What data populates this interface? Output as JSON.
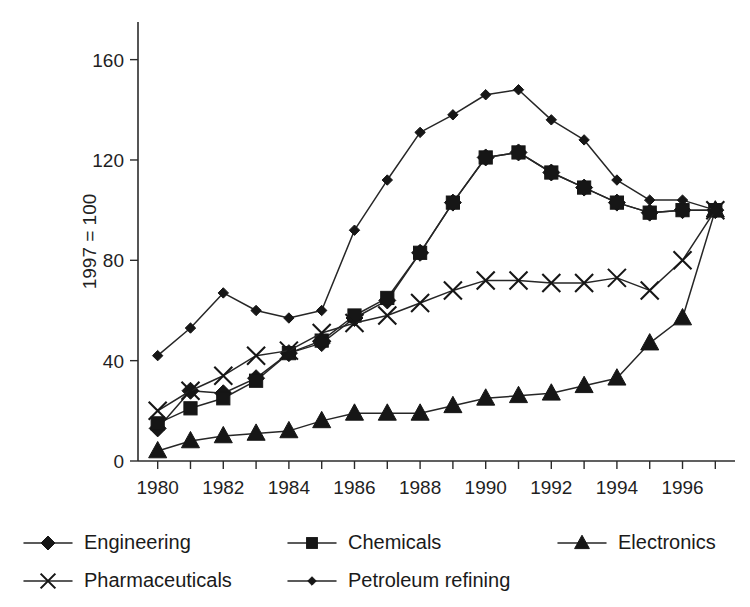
{
  "chart_data": {
    "type": "line",
    "title": "",
    "subtitle": "",
    "xlabel": "",
    "ylabel": "1997 = 100",
    "xlim": [
      1979.4,
      1997.6
    ],
    "ylim": [
      0,
      175
    ],
    "yticks": [
      0,
      40,
      80,
      120,
      160
    ],
    "ytick_labels": [
      "0",
      "40",
      "80",
      "120",
      "160"
    ],
    "x": [
      1980,
      1981,
      1982,
      1983,
      1984,
      1985,
      1986,
      1987,
      1988,
      1989,
      1990,
      1991,
      1992,
      1993,
      1994,
      1995,
      1996,
      1997
    ],
    "xticks": [
      1980,
      1981,
      1982,
      1983,
      1984,
      1985,
      1986,
      1987,
      1988,
      1989,
      1990,
      1991,
      1992,
      1993,
      1994,
      1995,
      1996,
      1997
    ],
    "xtick_labels": [
      "1980",
      "",
      "1982",
      "",
      "1984",
      "",
      "1986",
      "",
      "1988",
      "",
      "1990",
      "",
      "1992",
      "",
      "1994",
      "",
      "1996",
      ""
    ],
    "xtick_labels_shown": [
      "1980",
      "1982",
      "1984",
      "1986",
      "1988",
      "1990",
      "1992",
      "1994",
      "1996"
    ],
    "grid": false,
    "legend_position": "below",
    "line_color": "#262626",
    "series": [
      {
        "name": "Engineering",
        "marker": "diamond",
        "values": [
          13,
          28,
          27,
          33,
          43,
          47,
          57,
          64,
          83,
          103,
          121,
          123,
          115,
          109,
          103,
          99,
          100,
          100
        ]
      },
      {
        "name": "Chemicals",
        "marker": "square",
        "values": [
          15,
          21,
          25,
          32,
          43,
          48,
          58,
          65,
          83,
          103,
          121,
          123,
          115,
          109,
          103,
          99,
          100,
          100
        ]
      },
      {
        "name": "Electronics",
        "marker": "triangle",
        "values": [
          4,
          8,
          10,
          11,
          12,
          16,
          19,
          19,
          19,
          22,
          25,
          26,
          27,
          30,
          33,
          47,
          57,
          100
        ]
      },
      {
        "name": "Pharmaceuticals",
        "marker": "x",
        "values": [
          20,
          28,
          34,
          42,
          44,
          51,
          55,
          58,
          63,
          68,
          72,
          72,
          71,
          71,
          73,
          68,
          80,
          100
        ]
      },
      {
        "name": "Petroleum refining",
        "marker": "small-diamond",
        "values": [
          42,
          53,
          67,
          60,
          57,
          60,
          92,
          112,
          131,
          138,
          146,
          148,
          136,
          128,
          112,
          104,
          104,
          100
        ]
      }
    ],
    "series_display": [
      {
        "name": "Engineering",
        "marker": "diamond",
        "values": [
          13,
          28,
          27,
          33,
          43,
          47,
          57,
          64,
          83,
          103,
          121,
          123,
          115,
          109,
          103,
          99,
          100,
          100
        ]
      }
    ]
  },
  "legend": {
    "rows": [
      [
        {
          "label": "Engineering",
          "marker": "diamond"
        },
        {
          "label": "Chemicals",
          "marker": "square"
        },
        {
          "label": "Electronics",
          "marker": "triangle"
        }
      ],
      [
        {
          "label": "Pharmaceuticals",
          "marker": "x"
        },
        {
          "label": "Petroleum refining",
          "marker": "small-diamond"
        }
      ]
    ]
  }
}
